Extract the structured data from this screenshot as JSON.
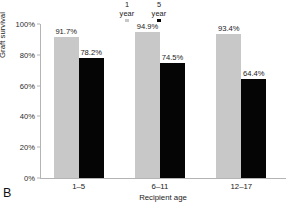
{
  "panel": {
    "letter": "B"
  },
  "chart_data": {
    "type": "bar",
    "title": "",
    "xlabel": "Recipient age",
    "ylabel": "Graft survival",
    "categories": [
      "1–5",
      "6–11",
      "12–17"
    ],
    "series": [
      {
        "name": "1 year",
        "legend_line1": "1",
        "legend_line2": "year",
        "color": "#c8c8c8",
        "values": [
          91.7,
          94.9,
          93.4
        ],
        "labels": [
          "91.7%",
          "94.9%",
          "93.4%"
        ]
      },
      {
        "name": "5 year",
        "legend_line1": "5",
        "legend_line2": "year",
        "color": "#000000",
        "values": [
          78.2,
          74.5,
          64.4
        ],
        "labels": [
          "78.2%",
          "74.5%",
          "64.4%"
        ]
      }
    ],
    "ylim": [
      0,
      100
    ],
    "yticks": [
      0,
      20,
      40,
      60,
      80,
      100
    ],
    "ytick_labels": [
      "0%",
      "20%",
      "40%",
      "60%",
      "80%",
      "100%"
    ],
    "grid": false,
    "legend_position": "top-center",
    "unit": "%"
  }
}
